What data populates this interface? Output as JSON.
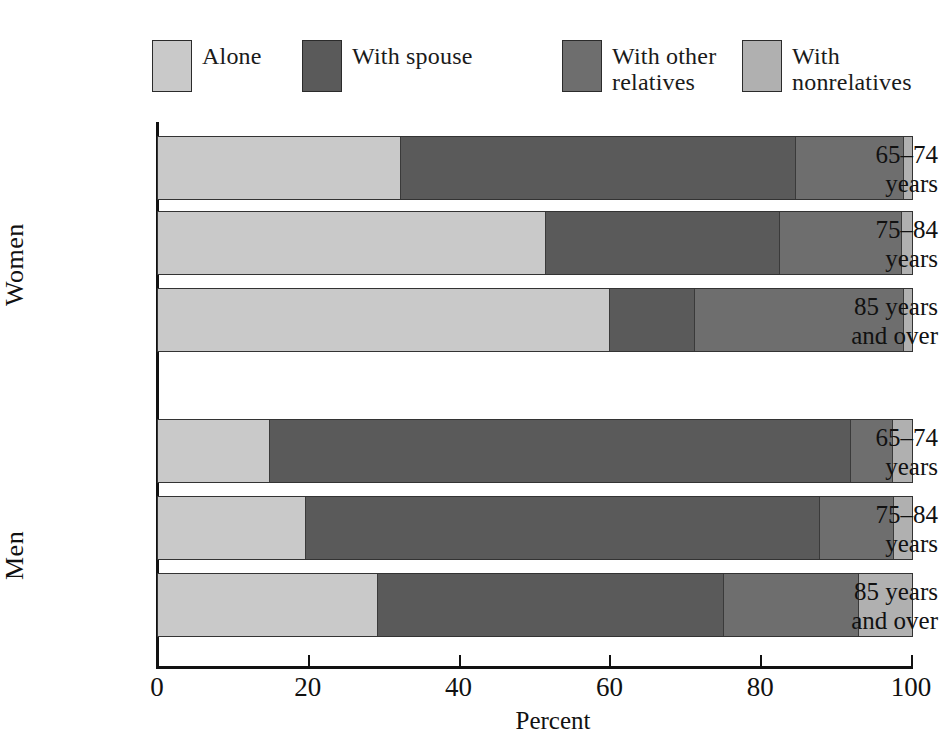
{
  "chart_data": {
    "type": "bar",
    "orientation": "horizontal",
    "stacked": true,
    "title": "",
    "xlabel": "Percent",
    "ylabel": "",
    "xlim": [
      0,
      100
    ],
    "xticks": [
      0,
      20,
      40,
      60,
      80,
      100
    ],
    "xtick_labels": [
      "0",
      "20",
      "40",
      "60",
      "80",
      "100"
    ],
    "grid": false,
    "legend_position": "top",
    "series": [
      {
        "name": "Alone",
        "color": "#c9c9c9",
        "values": [
          32.1,
          51.3,
          59.8,
          14.7,
          19.5,
          29.0
        ]
      },
      {
        "name": "With spouse",
        "color": "#5a5a5a",
        "values": [
          52.4,
          31.1,
          11.3,
          77.1,
          68.2,
          46.0
        ]
      },
      {
        "name": "With other relatives",
        "color": "#6e6e6e",
        "values": [
          14.3,
          16.1,
          27.7,
          5.5,
          9.8,
          17.8
        ]
      },
      {
        "name": "With nonrelatives",
        "color": "#b0b0b0",
        "values": [
          1.2,
          1.5,
          1.2,
          2.7,
          2.5,
          7.2
        ]
      }
    ],
    "groups": [
      {
        "name": "Women",
        "categories": [
          "65–74\nyears",
          "75–84\nyears",
          "85 years\nand over"
        ]
      },
      {
        "name": "Men",
        "categories": [
          "65–74\nyears",
          "75–84\nyears",
          "85 years\nand over"
        ]
      }
    ],
    "categories": [
      "Women 65–74 years",
      "Women 75–84 years",
      "Women 85 years and over",
      "Men 65–74 years",
      "Men 75–84 years",
      "Men 85 years and over"
    ]
  },
  "legend": {
    "items": [
      {
        "label": "Alone",
        "color": "#c9c9c9"
      },
      {
        "label": "With spouse",
        "color": "#5a5a5a"
      },
      {
        "label": "With other\nrelatives",
        "color": "#6e6e6e"
      },
      {
        "label": "With\nnonrelatives",
        "color": "#b0b0b0"
      }
    ]
  },
  "axis": {
    "x_title": "Percent",
    "x_tick_labels": [
      "0",
      "20",
      "40",
      "60",
      "80",
      "100"
    ]
  },
  "row_labels": [
    "65–74\nyears",
    "75–84\nyears",
    "85 years\nand over",
    "65–74\nyears",
    "75–84\nyears",
    "85 years\nand over"
  ],
  "group_labels": [
    "Women",
    "Men"
  ]
}
